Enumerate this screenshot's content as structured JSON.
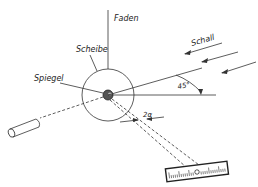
{
  "diagram": {
    "labels": {
      "thread": "Faden",
      "disc": "Scheibe",
      "mirror": "Spiegel",
      "sound": "Schall",
      "angle": "45°",
      "deflection": "2α"
    },
    "colors": {
      "line": "#333333",
      "mirror": "#555555",
      "background": "#ffffff"
    }
  }
}
